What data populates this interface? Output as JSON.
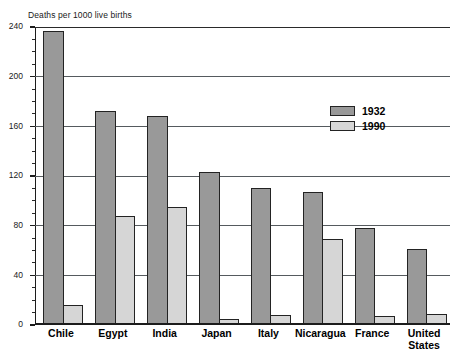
{
  "chart_data": {
    "type": "bar",
    "title": "Deaths per 1000 live births",
    "xlabel": "",
    "ylabel": "Deaths per 1000 live births",
    "ylim": [
      0,
      240
    ],
    "ytick_step": 40,
    "yminor_step": 10,
    "grid": true,
    "legend_position": "upper-right",
    "categories": [
      "Chile",
      "Egypt",
      "India",
      "Japan",
      "Italy",
      "Nicaragua",
      "France",
      "United States"
    ],
    "category_labels": [
      {
        "line1": "Chile",
        "line2": ""
      },
      {
        "line1": "Egypt",
        "line2": ""
      },
      {
        "line1": "India",
        "line2": ""
      },
      {
        "line1": "Japan",
        "line2": ""
      },
      {
        "line1": "Italy",
        "line2": ""
      },
      {
        "line1": "Nicaragua",
        "line2": ""
      },
      {
        "line1": "France",
        "line2": ""
      },
      {
        "line1": "United",
        "line2": "States"
      }
    ],
    "series": [
      {
        "name": "1932",
        "color": "#999999",
        "values": [
          237,
          172,
          168,
          123,
          110,
          107,
          78,
          61
        ]
      },
      {
        "name": "1990",
        "color": "#d6d6d6",
        "values": [
          16,
          88,
          95,
          5,
          8,
          69,
          7,
          9
        ]
      }
    ],
    "ytick_labels": [
      "240",
      "200",
      "160",
      "120",
      "80",
      "40",
      "0"
    ],
    "ytick_values": [
      240,
      200,
      160,
      120,
      80,
      40,
      0
    ]
  },
  "legend": {
    "items": [
      {
        "label": "1932",
        "color": "#999999"
      },
      {
        "label": "1990",
        "color": "#d6d6d6"
      }
    ]
  },
  "colors": {
    "series_1932": "#999999",
    "series_1990": "#d6d6d6",
    "axis": "#1c1c1c",
    "grid": "#555a5e",
    "background": "#ffffff"
  }
}
